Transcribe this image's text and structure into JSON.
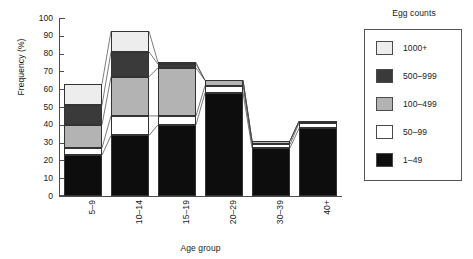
{
  "chart_data": {
    "type": "bar",
    "subtype": "stacked-bar-with-connectors",
    "title": "",
    "xlabel": "Age group",
    "ylabel": "Frequency (%)",
    "categories": [
      "5–9",
      "10–14",
      "15–19",
      "20–29",
      "30–39",
      "40+"
    ],
    "ylim": [
      0,
      100
    ],
    "y_ticks": [
      0,
      10,
      20,
      30,
      40,
      50,
      60,
      70,
      80,
      90,
      100
    ],
    "grid": false,
    "legend_position": "right",
    "legend_title": "Egg counts",
    "series": [
      {
        "name": "1–49",
        "color": "#0d0d0d",
        "values": [
          23,
          34,
          40,
          58,
          27,
          38
        ]
      },
      {
        "name": "50–99",
        "color": "#ffffff",
        "values": [
          4,
          11,
          5,
          4,
          2,
          3
        ]
      },
      {
        "name": "100–499",
        "color": "#b3b3b3",
        "values": [
          13,
          22,
          27,
          3,
          2,
          1
        ]
      },
      {
        "name": "500–999",
        "color": "#3a3a3a",
        "values": [
          11,
          14,
          2,
          0,
          0,
          0
        ]
      },
      {
        "name": "1000+",
        "color": "#ededed",
        "values": [
          12,
          11.5,
          1,
          0,
          0,
          0
        ]
      }
    ],
    "stack_totals": [
      63,
      92.5,
      75,
      65,
      31,
      42
    ],
    "series_order_bottom_to_top": [
      "1–49",
      "50–99",
      "100–499",
      "500–999",
      "1000+"
    ],
    "legend_order_top_to_bottom": [
      "1000+",
      "500–999",
      "100–499",
      "50–99",
      "1–49"
    ]
  },
  "axis": {
    "y_title": "Frequency (%)",
    "x_title": "Age group",
    "y_tick_labels": [
      "100",
      "90",
      "80",
      "70",
      "60",
      "50",
      "40",
      "30",
      "20",
      "10",
      "0"
    ],
    "x_tick_labels": [
      "5–9",
      "10–14",
      "15–19",
      "20–29",
      "30–39",
      "40+"
    ]
  },
  "legend": {
    "title": "Egg counts",
    "items": [
      {
        "label": "1000+",
        "color": "#ededed"
      },
      {
        "label": "500–999",
        "color": "#3a3a3a"
      },
      {
        "label": "100–499",
        "color": "#b3b3b3"
      },
      {
        "label": "50–99",
        "color": "#ffffff"
      },
      {
        "label": "1–49",
        "color": "#0d0d0d"
      }
    ]
  }
}
